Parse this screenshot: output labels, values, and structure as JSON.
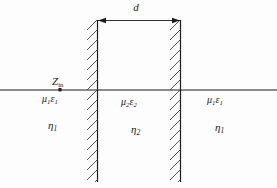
{
  "figure": {
    "background_color": "#fdfdfd",
    "line_color": "#1b1b1b",
    "hatch_color": "#3a3a3a"
  },
  "dimension": {
    "label": "d",
    "description": "slab thickness dimension line with arrowheads at both walls"
  },
  "axis": {
    "impedance_symbol": "Z",
    "impedance_subscript": "in",
    "marker": "tick-marker"
  },
  "regions": [
    {
      "name": "region-left",
      "medium_mu": "μ",
      "medium_mu_sub": "1",
      "medium_eps": "ε",
      "medium_eps_sub": "1",
      "impedance": "η",
      "impedance_sub": "1"
    },
    {
      "name": "region-middle",
      "medium_mu": "μ",
      "medium_mu_sub": "2",
      "medium_eps": "ε",
      "medium_eps_sub": "2",
      "impedance": "η",
      "impedance_sub": "2"
    },
    {
      "name": "region-right",
      "medium_mu": "μ",
      "medium_mu_sub": "1",
      "medium_eps": "ε",
      "medium_eps_sub": "1",
      "impedance": "η",
      "impedance_sub": "1"
    }
  ],
  "labels": {
    "d": "d",
    "zin_main": "Z",
    "zin_sub": "in",
    "mu1eps1_left_mu": "μ",
    "mu1eps1_left_mu_sub": "1",
    "mu1eps1_left_eps": "ε",
    "mu1eps1_left_eps_sub": "1",
    "eta1_left": "η",
    "eta1_left_sub": "1",
    "mu2eps2_mu": "μ",
    "mu2eps2_mu_sub": "2",
    "mu2eps2_eps": "ε",
    "mu2eps2_eps_sub": "2",
    "eta2": "η",
    "eta2_sub": "2",
    "mu1eps1_right_mu": "μ",
    "mu1eps1_right_mu_sub": "1",
    "mu1eps1_right_eps": "ε",
    "mu1eps1_right_eps_sub": "1",
    "eta1_right": "η",
    "eta1_right_sub": "1"
  },
  "geometry": {
    "left_wall_x": 97,
    "right_wall_x": 180,
    "wall_top_y": 20,
    "wall_bottom_y": 182,
    "axis_y": 90,
    "dimension_line_y": 20
  }
}
